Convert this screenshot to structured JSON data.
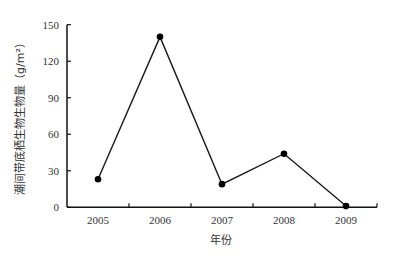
{
  "chart_data": {
    "type": "line",
    "title": "",
    "xlabel": "年份",
    "ylabel": "潮间带底栖生物生物量（g/m²）",
    "categories": [
      "2005",
      "2006",
      "2007",
      "2008",
      "2009"
    ],
    "values": [
      23,
      140,
      19,
      44,
      1
    ],
    "yticks": [
      "0",
      "30",
      "60",
      "90",
      "120",
      "150"
    ],
    "ylim": [
      0,
      150
    ],
    "grid": false,
    "legend": "none",
    "line_color": "#1a1a1a",
    "marker": "filled-circle"
  }
}
